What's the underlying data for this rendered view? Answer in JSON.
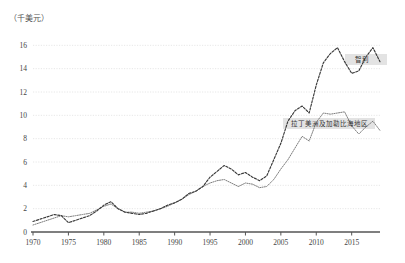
{
  "unit_label": "（千美元）",
  "chart_data": {
    "type": "line",
    "title": "",
    "subtitle": "",
    "xlabel": "",
    "ylabel": "",
    "unit": "（千美元）",
    "grid": true,
    "legend_position": "inline-annotation",
    "xlim": [
      1970,
      2019
    ],
    "ylim": [
      0,
      16.8
    ],
    "yticks": [
      0,
      2,
      4,
      6,
      8,
      10,
      12,
      14,
      16
    ],
    "ytick_labels": [
      "0",
      "2",
      "4",
      "6",
      "8",
      "10",
      "12",
      "14",
      "16"
    ],
    "xticks": [
      1970,
      1975,
      1980,
      1985,
      1990,
      1995,
      2000,
      2005,
      2010,
      2015
    ],
    "xtick_labels": [
      "1970",
      "1975",
      "1980",
      "1985",
      "1990",
      "1995",
      "2000",
      "2005",
      "2010",
      "2015"
    ],
    "x": [
      1970,
      1971,
      1972,
      1973,
      1974,
      1975,
      1976,
      1977,
      1978,
      1979,
      1980,
      1981,
      1982,
      1983,
      1984,
      1985,
      1986,
      1987,
      1988,
      1989,
      1990,
      1991,
      1992,
      1993,
      1994,
      1995,
      1996,
      1997,
      1998,
      1999,
      2000,
      2001,
      2002,
      2003,
      2004,
      2005,
      2006,
      2007,
      2008,
      2009,
      2010,
      2011,
      2012,
      2013,
      2014,
      2015,
      2016,
      2017,
      2018,
      2019
    ],
    "series": [
      {
        "name": "智利",
        "label": "智利",
        "style": "dashed",
        "color": "#3a3a3a",
        "values": [
          0.9,
          1.1,
          1.3,
          1.5,
          1.4,
          0.8,
          1.0,
          1.2,
          1.4,
          1.8,
          2.3,
          2.6,
          2.0,
          1.7,
          1.6,
          1.5,
          1.6,
          1.8,
          2.0,
          2.3,
          2.5,
          2.8,
          3.3,
          3.5,
          3.9,
          4.7,
          5.2,
          5.7,
          5.4,
          4.9,
          5.1,
          4.7,
          4.4,
          4.8,
          6.2,
          7.6,
          9.5,
          10.4,
          10.8,
          10.2,
          12.6,
          14.5,
          15.3,
          15.8,
          14.6,
          13.6,
          13.8,
          15.0,
          15.8,
          14.6
        ],
        "value_end": 15.1
      },
      {
        "name": "拉丁美洲及加勒比海地区",
        "label": "拉丁美洲及加勒比海地区",
        "style": "dotted",
        "color": "#6f6f6f",
        "values": [
          0.6,
          0.8,
          1.0,
          1.2,
          1.4,
          1.3,
          1.4,
          1.5,
          1.6,
          1.9,
          2.2,
          2.4,
          2.0,
          1.7,
          1.7,
          1.6,
          1.7,
          1.8,
          2.0,
          2.2,
          2.5,
          2.8,
          3.2,
          3.5,
          3.9,
          4.2,
          4.4,
          4.5,
          4.2,
          3.9,
          4.2,
          4.1,
          3.8,
          3.9,
          4.5,
          5.4,
          6.2,
          7.2,
          8.2,
          7.8,
          9.4,
          10.2,
          10.1,
          10.2,
          10.3,
          9.1,
          8.4,
          9.0,
          9.5,
          8.7
        ],
        "value_end": 8.7
      }
    ]
  },
  "annotations": [
    {
      "name": "series-label-chile",
      "text": "智利"
    },
    {
      "name": "series-label-lac",
      "text": "拉丁美洲及加勒比海地区"
    }
  ]
}
